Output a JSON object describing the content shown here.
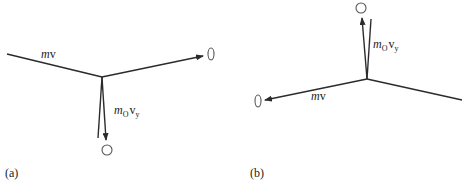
{
  "figure": {
    "panels": [
      {
        "id": "a",
        "caption": "(a)",
        "vectors": [
          {
            "name": "incident",
            "label_main": "m",
            "label_rest": "v",
            "from": [
              7,
              54
            ],
            "to": [
              102,
              77
            ],
            "arrow": false
          },
          {
            "name": "scattered",
            "from": [
              102,
              77
            ],
            "to": [
              203,
              56
            ],
            "arrow": true
          },
          {
            "name": "recoil",
            "label_main": "m",
            "label_sub": "O",
            "label_var": "v",
            "label_var_sub": "y",
            "from": [
              102,
              77
            ],
            "to": [
              106,
              140
            ],
            "arrow": true
          },
          {
            "name": "recoil-return",
            "from": [
              102,
              77
            ],
            "to": [
              98,
              138
            ],
            "arrow": false
          }
        ],
        "particles": [
          {
            "shape": "ellipse",
            "cx": 211,
            "cy": 54,
            "rx": 3,
            "ry": 6
          },
          {
            "shape": "circle",
            "cx": 107,
            "cy": 150,
            "r": 5
          }
        ]
      },
      {
        "id": "b",
        "caption": "(b)",
        "vectors": [
          {
            "name": "incident",
            "from": [
              462,
              100
            ],
            "to": [
              367,
              79
            ],
            "arrow": false
          },
          {
            "name": "scattered",
            "label_main": "m",
            "label_rest": "v",
            "from": [
              367,
              79
            ],
            "to": [
              265,
              100
            ],
            "arrow": true
          },
          {
            "name": "recoil",
            "label_main": "m",
            "label_sub": "O",
            "label_var": "v",
            "label_var_sub": "y",
            "from": [
              367,
              79
            ],
            "to": [
              362,
              18
            ],
            "arrow": true
          },
          {
            "name": "recoil-return",
            "from": [
              367,
              79
            ],
            "to": [
              371,
              19
            ],
            "arrow": false
          }
        ],
        "particles": [
          {
            "shape": "circle",
            "cx": 361,
            "cy": 8,
            "r": 5
          },
          {
            "shape": "ellipse",
            "cx": 258,
            "cy": 101,
            "rx": 3,
            "ry": 6
          }
        ]
      }
    ],
    "labels": {
      "a_mv_m": "m",
      "a_mv_v": "v",
      "a_mo_m": "m",
      "a_mo_o": "O",
      "a_mo_v": "v",
      "a_mo_y": "y",
      "b_mv_m": "m",
      "b_mv_v": "v",
      "b_mo_m": "m",
      "b_mo_o": "O",
      "b_mo_v": "v",
      "b_mo_y": "y",
      "caption_a": "(a)",
      "caption_b": "(b)"
    }
  }
}
